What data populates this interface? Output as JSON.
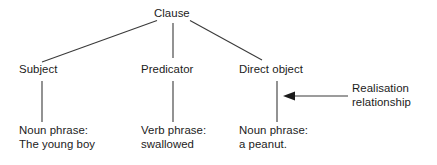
{
  "diagram": {
    "type": "linguistic-tree",
    "background_color": "#ffffff",
    "line_color": "#3a3a3a",
    "text_color": "#1b1b1b",
    "root": {
      "label": "Clause"
    },
    "functions": [
      {
        "label": "Subject"
      },
      {
        "label": "Predicator"
      },
      {
        "label": "Direct object"
      }
    ],
    "realisations": [
      {
        "line1": "Noun phrase:",
        "line2": "The young boy"
      },
      {
        "line1": "Verb phrase:",
        "line2": "swallowed"
      },
      {
        "line1": "Noun phrase:",
        "line2": "a peanut."
      }
    ],
    "annotation": {
      "line1": "Realisation",
      "line2": "relationship",
      "arrow_direction": "left"
    }
  }
}
